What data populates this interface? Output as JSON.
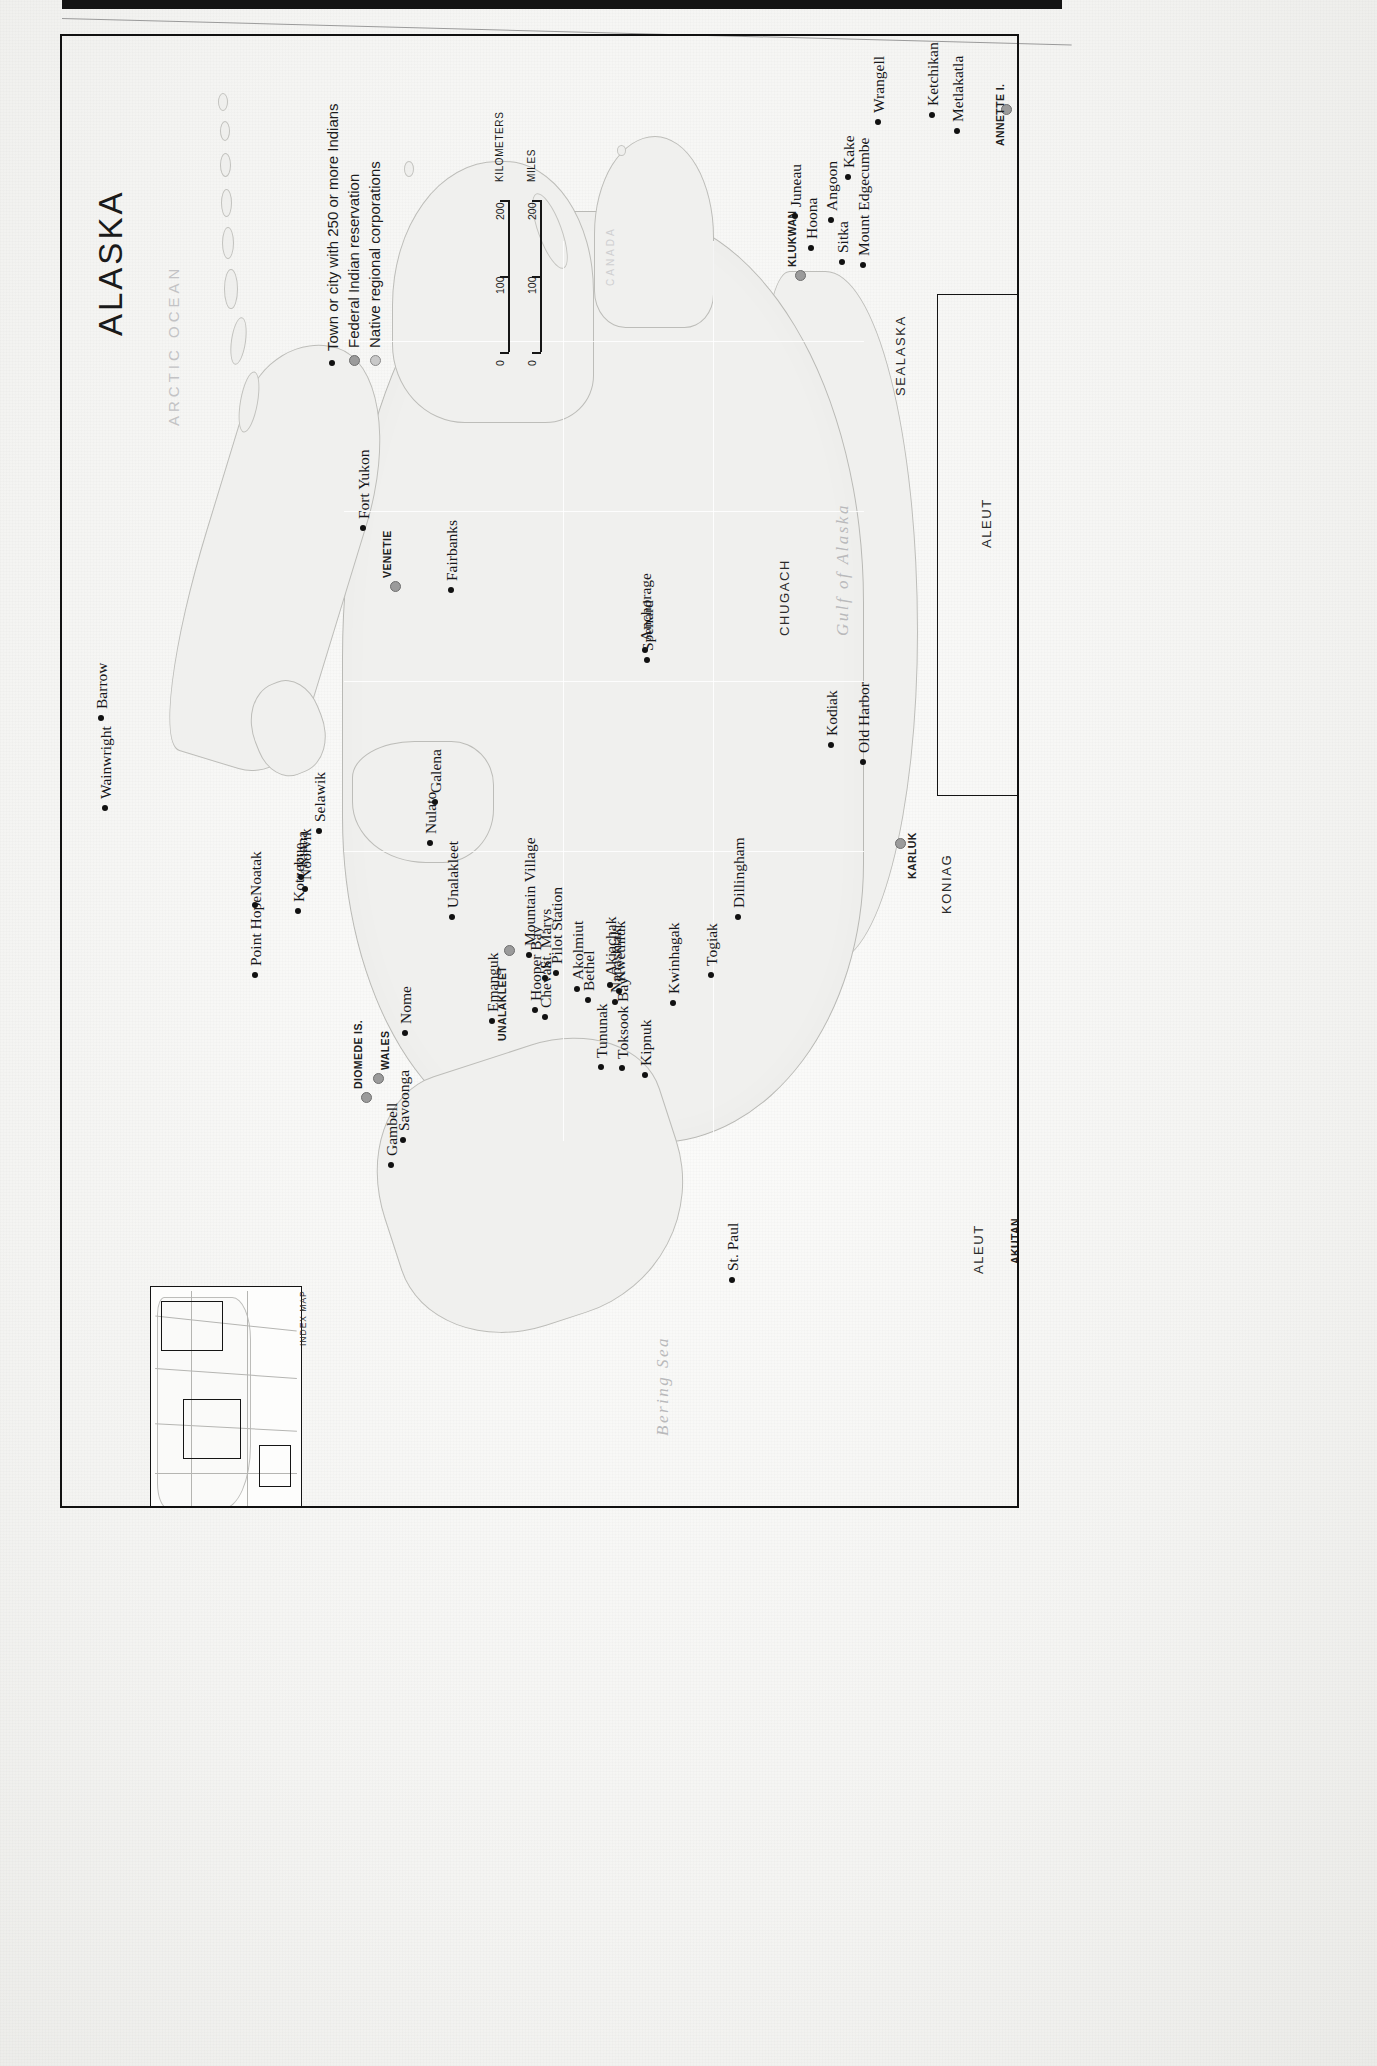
{
  "map": {
    "title": "ALASKA",
    "legend": [
      {
        "key": "town-dot",
        "label": "Town or city with 250 or more Indians"
      },
      {
        "key": "reservation-dot",
        "label": "Federal Indian reservation"
      },
      {
        "key": "corporation-dot",
        "label": "Native regional corporations"
      }
    ],
    "scale": {
      "kilometers": {
        "unit": "KILOMETERS",
        "ticks": [
          "0",
          "100",
          "200"
        ]
      },
      "miles": {
        "unit": "MILES",
        "ticks": [
          "0",
          "100",
          "200"
        ]
      }
    },
    "index_map_label": "INDEX MAP",
    "water_bodies": [
      {
        "name": "ARCTIC OCEAN",
        "style": "caps"
      },
      {
        "name": "Bering Sea",
        "style": "italic"
      },
      {
        "name": "Gulf of Alaska",
        "style": "italic"
      }
    ],
    "country_labels": [
      "CANADA"
    ],
    "regional_corporations": [
      "SEALASKA",
      "CHUGACH",
      "KONIAG",
      "ALEUT",
      "ALEUT"
    ],
    "reservations": [
      "KLUKWAN",
      "VENETIE",
      "UNALAKLEET",
      "WALES",
      "DIOMEDE IS.",
      "KARLUK",
      "AKUTAN",
      "ANNETTE I."
    ],
    "towns": [
      "Barrow",
      "Wainwright",
      "Point Hope",
      "Noatak",
      "Kotzebue",
      "Kiana",
      "Noorvik",
      "Selawik",
      "Nome",
      "Gambell",
      "Savoonga",
      "Unalakleet",
      "Nulato",
      "Galena",
      "Fort Yukon",
      "Fairbanks",
      "Anchorage",
      "Spenard",
      "Emanguk",
      "Hooper Bay",
      "Chevak",
      "Mountain Village",
      "St. Marys",
      "Pilot Station",
      "Akolmiut",
      "Bethel",
      "Akiachak",
      "Kwethluk",
      "Napaskiak",
      "Tununak",
      "Toksook Bay",
      "Kipnuk",
      "Kwinhagak",
      "Togiak",
      "Dillingham",
      "St. Paul",
      "Kodiak",
      "Old Harbor",
      "Juneau",
      "Hoona",
      "Angoon",
      "Kake",
      "Sitka",
      "Mount Edgecumbe",
      "Wrangell",
      "Ketchikan",
      "Metlakatla"
    ]
  },
  "features": {
    "towns": [
      {
        "name": "Barrow",
        "x": 96,
        "y": 713,
        "anchor": "se"
      },
      {
        "name": "Wainwright",
        "x": 100,
        "y": 803,
        "anchor": "se"
      },
      {
        "name": "Point Hope",
        "x": 250,
        "y": 970,
        "anchor": "se"
      },
      {
        "name": "Noatak",
        "x": 250,
        "y": 900,
        "anchor": "se"
      },
      {
        "name": "Kotzebue",
        "x": 293,
        "y": 906,
        "anchor": "se"
      },
      {
        "name": "Kiana",
        "x": 296,
        "y": 872,
        "anchor": "se"
      },
      {
        "name": "Noorvik",
        "x": 300,
        "y": 884,
        "anchor": "se"
      },
      {
        "name": "Selawik",
        "x": 314,
        "y": 826,
        "anchor": "se"
      },
      {
        "name": "Nome",
        "x": 400,
        "y": 1028,
        "anchor": "se"
      },
      {
        "name": "Gambell",
        "x": 386,
        "y": 1160,
        "anchor": "se"
      },
      {
        "name": "Savoonga",
        "x": 398,
        "y": 1135,
        "anchor": "se"
      },
      {
        "name": "Unalakleet",
        "x": 447,
        "y": 912,
        "anchor": "se"
      },
      {
        "name": "Nulato",
        "x": 425,
        "y": 838,
        "anchor": "se"
      },
      {
        "name": "Galena",
        "x": 430,
        "y": 797,
        "anchor": "se"
      },
      {
        "name": "Fort Yukon",
        "x": 358,
        "y": 523,
        "anchor": "se"
      },
      {
        "name": "Fairbanks",
        "x": 446,
        "y": 585,
        "anchor": "se"
      },
      {
        "name": "Anchorage",
        "x": 640,
        "y": 645,
        "anchor": "se"
      },
      {
        "name": "Spenard",
        "x": 642,
        "y": 655,
        "anchor": "se"
      },
      {
        "name": "Emanguk",
        "x": 487,
        "y": 1016,
        "anchor": "se"
      },
      {
        "name": "Hooper Bay",
        "x": 530,
        "y": 1005,
        "anchor": "se"
      },
      {
        "name": "Chevak",
        "x": 540,
        "y": 1012,
        "anchor": "se"
      },
      {
        "name": "Mountain Village",
        "x": 524,
        "y": 950,
        "anchor": "se"
      },
      {
        "name": "St. Marys",
        "x": 540,
        "y": 973,
        "anchor": "se"
      },
      {
        "name": "Pilot Station",
        "x": 551,
        "y": 968,
        "anchor": "se"
      },
      {
        "name": "Akolmiut",
        "x": 572,
        "y": 984,
        "anchor": "se"
      },
      {
        "name": "Bethel",
        "x": 583,
        "y": 995,
        "anchor": "se"
      },
      {
        "name": "Akiachak",
        "x": 605,
        "y": 980,
        "anchor": "se"
      },
      {
        "name": "Kwethluk",
        "x": 614,
        "y": 986,
        "anchor": "se"
      },
      {
        "name": "Napaskiak",
        "x": 610,
        "y": 997,
        "anchor": "se"
      },
      {
        "name": "Tununak",
        "x": 596,
        "y": 1062,
        "anchor": "se"
      },
      {
        "name": "Toksook Bay",
        "x": 617,
        "y": 1063,
        "anchor": "se"
      },
      {
        "name": "Kipnuk",
        "x": 640,
        "y": 1070,
        "anchor": "se"
      },
      {
        "name": "Kwinhagak",
        "x": 668,
        "y": 998,
        "anchor": "se"
      },
      {
        "name": "Togiak",
        "x": 706,
        "y": 970,
        "anchor": "se"
      },
      {
        "name": "Dillingham",
        "x": 733,
        "y": 912,
        "anchor": "se"
      },
      {
        "name": "St. Paul",
        "x": 727,
        "y": 1275,
        "anchor": "se"
      },
      {
        "name": "Kodiak",
        "x": 826,
        "y": 740,
        "anchor": "se"
      },
      {
        "name": "Old Harbor",
        "x": 858,
        "y": 757,
        "anchor": "se"
      },
      {
        "name": "Juneau",
        "x": 790,
        "y": 211,
        "anchor": "se"
      },
      {
        "name": "Hoona",
        "x": 806,
        "y": 243,
        "anchor": "se"
      },
      {
        "name": "Angoon",
        "x": 826,
        "y": 215,
        "anchor": "se"
      },
      {
        "name": "Kake",
        "x": 843,
        "y": 172,
        "anchor": "se"
      },
      {
        "name": "Sitka",
        "x": 837,
        "y": 257,
        "anchor": "se"
      },
      {
        "name": "Mount Edgecumbe",
        "x": 858,
        "y": 260,
        "anchor": "se"
      },
      {
        "name": "Wrangell",
        "x": 873,
        "y": 117,
        "anchor": "se"
      },
      {
        "name": "Ketchikan",
        "x": 927,
        "y": 110,
        "anchor": "se"
      },
      {
        "name": "Metlakatla",
        "x": 952,
        "y": 126,
        "anchor": "se"
      }
    ]
  },
  "colors": {
    "land": "#efefed",
    "coastline": "#bdbdb9",
    "water": "#f7f7f5",
    "town_dot": "#111111",
    "reservation_dot": "#9b9b9b",
    "frame": "#111111",
    "ocean_text": "#bcbcbe"
  }
}
